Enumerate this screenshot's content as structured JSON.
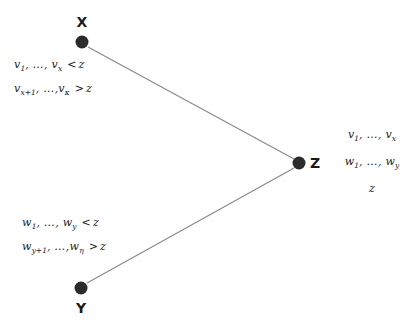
{
  "diagram": {
    "title": "",
    "nodes": [
      {
        "id": "x",
        "label": "X",
        "cx": 82,
        "cy": 42,
        "label_x": 82,
        "label_y": 22
      },
      {
        "id": "y",
        "label": "Y",
        "cx": 81,
        "cy": 288,
        "label_x": 81,
        "label_y": 308
      },
      {
        "id": "z",
        "label": "Z",
        "cx": 299,
        "cy": 163,
        "label_x": 315,
        "label_y": 163
      }
    ],
    "edges": [
      {
        "from": "x",
        "to": "z",
        "x1": 88,
        "y1": 47,
        "x2": 294,
        "y2": 159
      },
      {
        "from": "y",
        "to": "z",
        "x1": 87,
        "y1": 283,
        "x2": 294,
        "y2": 168
      }
    ],
    "edge_color": "#8a8a8a",
    "node_color": "#2b2b2b",
    "text_color": "#1a1a1a",
    "background": "#ffffff"
  },
  "labels": {
    "upper_left": {
      "line1": {
        "base1": "v",
        "sub1": "1",
        "sep1": ",",
        "dots": "…",
        "sep2": ",",
        "base2": "v",
        "sub2": "x",
        "operator": "<",
        "compare": "z"
      },
      "line2": {
        "base1": "v",
        "sub1": "x+1",
        "sep1": ",",
        "dots": "…",
        "sep2": ",",
        "base2": "v",
        "sub2": "κ",
        "operator": ">",
        "compare": "z"
      }
    },
    "lower_left": {
      "line1": {
        "base1": "w",
        "sub1": "1",
        "sep1": ",",
        "dots": "…",
        "sep2": ",",
        "base2": "w",
        "sub2": "y",
        "operator": "<",
        "compare": "z"
      },
      "line2": {
        "base1": "w",
        "sub1": "y+1",
        "sep1": ",",
        "dots": "…",
        "sep2": ",",
        "base2": "w",
        "sub2": "η",
        "operator": ">",
        "compare": "z"
      }
    },
    "right": {
      "line1": {
        "base1": "v",
        "sub1": "1",
        "sep1": ",",
        "dots": "…",
        "sep2": ",",
        "base2": "v",
        "sub2": "x"
      },
      "line2": {
        "base1": "w",
        "sub1": "1",
        "sep1": ",",
        "dots": "…",
        "sep2": ",",
        "base2": "w",
        "sub2": "y"
      },
      "line3": {
        "value": "z"
      }
    }
  }
}
